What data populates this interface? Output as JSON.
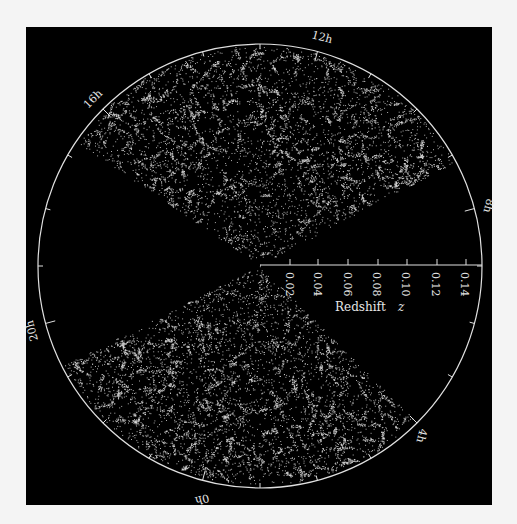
{
  "chart_data": {
    "type": "scatter",
    "subtype": "polar-wedge (redshift survey cone diagram)",
    "title": "",
    "radial_axis": {
      "label": "Redshift",
      "label_italic_symbol": "z",
      "ticks": [
        "0.02",
        "0.04",
        "0.06",
        "0.08",
        "0.10",
        "0.12",
        "0.14"
      ],
      "tick_values": [
        0.02,
        0.04,
        0.06,
        0.08,
        0.1,
        0.12,
        0.14
      ],
      "range": [
        0,
        0.15
      ]
    },
    "angular_axis": {
      "unit": "hours (right ascension)",
      "labels": [
        "12h",
        "8h",
        "4h",
        "0h",
        "20h",
        "16h"
      ],
      "label_hours": [
        12,
        8,
        4,
        0,
        20,
        16
      ],
      "minor_tick_step_hours": 1
    },
    "series": [
      {
        "name": "north wedge galaxies",
        "ra_range_hours": [
          9.8,
          17.2
        ],
        "z_range": [
          0,
          0.15
        ]
      },
      {
        "name": "south wedge galaxies",
        "ra_range_hours": [
          21.6,
          4.0
        ],
        "z_range": [
          0,
          0.15
        ]
      }
    ],
    "colors": {
      "background": "#000000",
      "points": "#d8d8d8",
      "axes": "#e0e0e0",
      "page": "#f4f4f4"
    }
  },
  "labels": {
    "h12": "12h",
    "h8": "8h",
    "h4": "4h",
    "h0": "0h",
    "h20": "20h",
    "h16": "16h",
    "axis_title": "Redshift",
    "axis_symbol": "z",
    "t1": "0.02",
    "t2": "0.04",
    "t3": "0.06",
    "t4": "0.08",
    "t5": "0.10",
    "t6": "0.12",
    "t7": "0.14"
  }
}
